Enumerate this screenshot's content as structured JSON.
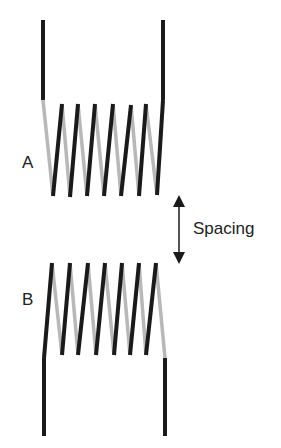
{
  "diagram": {
    "title": "",
    "coils": [
      {
        "label": "A",
        "turns": 7
      },
      {
        "label": "B",
        "turns": 7
      }
    ],
    "spacing_label": "Spacing",
    "colors": {
      "front_wire": "#1a1a1a",
      "back_wire": "#b8b8b8",
      "arrow": "#1a1a1a"
    }
  }
}
